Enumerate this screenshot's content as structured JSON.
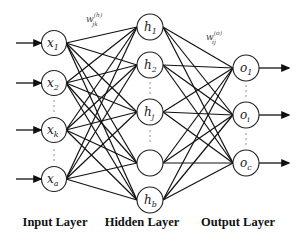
{
  "diagram": {
    "type": "feedforward-neural-network",
    "layers": [
      {
        "name": "Input Layer",
        "nodes": [
          {
            "base": "x",
            "sub": "1"
          },
          {
            "base": "x",
            "sub": "2"
          },
          {
            "base": "x",
            "sub": "k"
          },
          {
            "base": "x",
            "sub": "a"
          }
        ],
        "ellipsis_after": [
          1,
          2
        ]
      },
      {
        "name": "Hidden Layer",
        "nodes": [
          {
            "base": "h",
            "sub": "1"
          },
          {
            "base": "h",
            "sub": "2"
          },
          {
            "base": "h",
            "sub": "j"
          },
          {
            "base": "",
            "sub": ""
          },
          {
            "base": "h",
            "sub": "b"
          }
        ],
        "ellipsis_after": [
          1,
          2
        ]
      },
      {
        "name": "Output Layer",
        "nodes": [
          {
            "base": "o",
            "sub": "1"
          },
          {
            "base": "o",
            "sub": "i"
          },
          {
            "base": "o",
            "sub": "c"
          }
        ],
        "ellipsis_after": [
          0,
          1
        ]
      }
    ],
    "weights": {
      "input_hidden": {
        "base": "w",
        "sup": "(h)",
        "sub": "jk"
      },
      "hidden_output": {
        "base": "w",
        "sup": "(o)",
        "sub": "ij"
      }
    },
    "connectivity": "fully-connected",
    "colors": {
      "line": "#111111",
      "node_fill": "#ffffff",
      "node_stroke": "#222222",
      "background": "#ffffff"
    }
  },
  "labels": {
    "input_layer": "Input Layer",
    "hidden_layer": "Hidden Layer",
    "output_layer": "Output Layer",
    "w_h_base": "w",
    "w_h_sup": "(h)",
    "w_h_sub": "jk",
    "w_o_base": "w",
    "w_o_sup": "(o)",
    "w_o_sub": "ij",
    "x1": "x",
    "x1s": "1",
    "x2": "x",
    "x2s": "2",
    "xk": "x",
    "xks": "k",
    "xa": "x",
    "xas": "a",
    "h1": "h",
    "h1s": "1",
    "h2": "h",
    "h2s": "2",
    "hj": "h",
    "hjs": "j",
    "hb": "h",
    "hbs": "b",
    "o1": "o",
    "o1s": "1",
    "oi": "o",
    "ois": "i",
    "oc": "o",
    "ocs": "c"
  }
}
